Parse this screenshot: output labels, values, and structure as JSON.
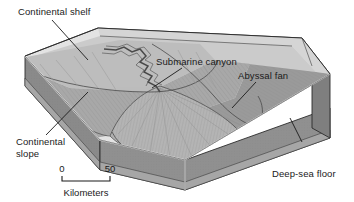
{
  "figure": {
    "background_color": "#ffffff",
    "text_color": "#1a1a1a"
  },
  "labels": {
    "continental_shelf": "Continental shelf",
    "submarine_canyon": "Submarine canyon",
    "abyssal_fan": "Abyssal fan",
    "continental_slope_line1": "Continental",
    "continental_slope_line2": "slope",
    "deep_sea_floor": "Deep-sea floor"
  },
  "scale": {
    "min": "0",
    "max": "50",
    "units": "Kilometers"
  },
  "colors": {
    "top_water_surface": "#e9e9e9",
    "shelf_surface": "#bdbdbd",
    "slope_surface": "#a8a8a8",
    "fan_surface": "#b4b4b4",
    "deep_floor": "#9a9a9a",
    "left_face": "#8a8a8a",
    "right_face": "#8f8f8f",
    "lower_stratum": "#a6a6a6",
    "edge_stroke": "#2b2b2b",
    "highlight_stroke": "#f2f2f2"
  }
}
